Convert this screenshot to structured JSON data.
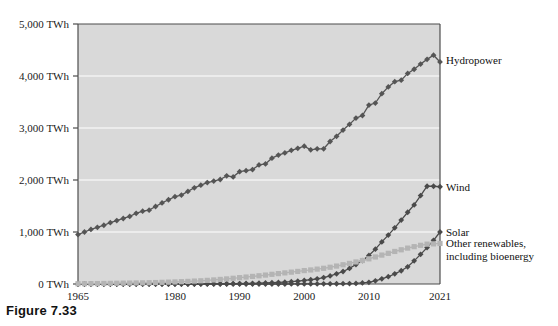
{
  "figure": {
    "caption": "Figure 7.33"
  },
  "chart_data": {
    "type": "line",
    "title": "",
    "subtitle": "",
    "xlabel": "",
    "ylabel": "",
    "xlim": [
      1965,
      2021
    ],
    "ylim": [
      0,
      5000
    ],
    "grid": true,
    "legend_position": "right-inline",
    "unit": "TWh",
    "y_ticks": [
      0,
      1000,
      2000,
      3000,
      4000,
      5000
    ],
    "y_tick_labels": [
      "0 TWh",
      "1,000 TWh",
      "2,000 TWh",
      "3,000 TWh",
      "4,000 TWh",
      "5,000 TWh"
    ],
    "x_ticks": [
      1965,
      1980,
      1990,
      2000,
      2010,
      2021
    ],
    "x_tick_labels": [
      "1965",
      "1980",
      "1990",
      "2000",
      "2010",
      "2021"
    ],
    "x": [
      1965,
      1966,
      1967,
      1968,
      1969,
      1970,
      1971,
      1972,
      1973,
      1974,
      1975,
      1976,
      1977,
      1978,
      1979,
      1980,
      1981,
      1982,
      1983,
      1984,
      1985,
      1986,
      1987,
      1988,
      1989,
      1990,
      1991,
      1992,
      1993,
      1994,
      1995,
      1996,
      1997,
      1998,
      1999,
      2000,
      2001,
      2002,
      2003,
      2004,
      2005,
      2006,
      2007,
      2008,
      2009,
      2010,
      2011,
      2012,
      2013,
      2014,
      2015,
      2016,
      2017,
      2018,
      2019,
      2020,
      2021
    ],
    "series": [
      {
        "name": "Hydropower",
        "color": "#555555",
        "marker": "diamond",
        "label_anchor_year": 2021,
        "label_anchor_value": 4300,
        "values": [
          950,
          1000,
          1050,
          1090,
          1130,
          1180,
          1220,
          1260,
          1300,
          1360,
          1400,
          1420,
          1490,
          1560,
          1620,
          1680,
          1710,
          1780,
          1850,
          1900,
          1950,
          1980,
          2010,
          2080,
          2060,
          2160,
          2180,
          2200,
          2290,
          2310,
          2420,
          2480,
          2520,
          2570,
          2610,
          2650,
          2580,
          2600,
          2600,
          2740,
          2840,
          2960,
          3070,
          3190,
          3240,
          3440,
          3480,
          3660,
          3790,
          3890,
          3920,
          4050,
          4130,
          4230,
          4320,
          4400,
          4270
        ]
      },
      {
        "name": "Wind",
        "color": "#4a4a4a",
        "marker": "diamond",
        "label_anchor_year": 2021,
        "label_anchor_value": 1870,
        "values": [
          0,
          0,
          0,
          0,
          0,
          0,
          0,
          0,
          0,
          0,
          0,
          0,
          0,
          0,
          0,
          0,
          0,
          0,
          0,
          1,
          2,
          3,
          4,
          5,
          6,
          8,
          10,
          12,
          15,
          19,
          24,
          30,
          36,
          44,
          55,
          68,
          82,
          100,
          123,
          156,
          195,
          240,
          300,
          375,
          450,
          550,
          670,
          810,
          940,
          1080,
          1230,
          1380,
          1520,
          1700,
          1880,
          1880,
          1870
        ]
      },
      {
        "name": "Solar",
        "color": "#4a4a4a",
        "marker": "diamond",
        "label_anchor_year": 2021,
        "label_anchor_value": 1000,
        "values": [
          0,
          0,
          0,
          0,
          0,
          0,
          0,
          0,
          0,
          0,
          0,
          0,
          0,
          0,
          0,
          0,
          0,
          0,
          0,
          0,
          0,
          0,
          0,
          0,
          0,
          0,
          0,
          0,
          0,
          0,
          0,
          0,
          0,
          1,
          1,
          1,
          2,
          2,
          3,
          4,
          5,
          6,
          8,
          12,
          20,
          32,
          62,
          100,
          140,
          195,
          255,
          330,
          445,
          570,
          700,
          840,
          1000
        ]
      },
      {
        "name": "Other renewables, including bioenergy",
        "color": "#b4b4b4",
        "marker": "square",
        "label_anchor_year": 2021,
        "label_anchor_value": 780,
        "values": [
          5,
          6,
          7,
          8,
          10,
          12,
          14,
          16,
          18,
          20,
          22,
          25,
          28,
          32,
          36,
          40,
          45,
          50,
          56,
          62,
          70,
          78,
          88,
          98,
          110,
          122,
          134,
          146,
          158,
          172,
          186,
          200,
          214,
          228,
          242,
          258,
          270,
          286,
          302,
          322,
          345,
          370,
          396,
          424,
          452,
          484,
          520,
          556,
          590,
          626,
          658,
          690,
          718,
          744,
          766,
          772,
          780
        ]
      }
    ],
    "series_labels": [
      {
        "text": "Hydropower"
      },
      {
        "text": "Wind"
      },
      {
        "text": "Solar"
      },
      {
        "text": "Other renewables,",
        "text2": "including bioenergy"
      }
    ]
  }
}
